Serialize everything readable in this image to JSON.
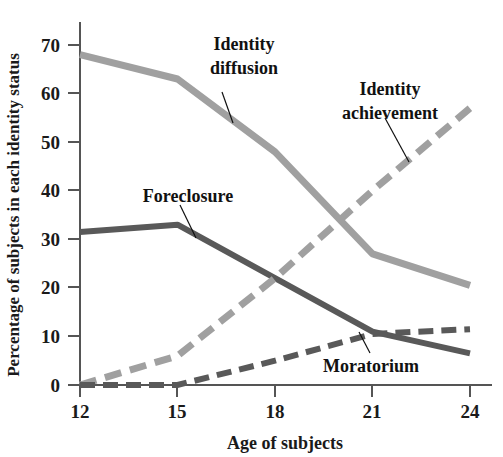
{
  "chart_data": {
    "type": "line",
    "title": "",
    "xlabel": "Age of subjects",
    "ylabel": "Percentage of subjects in each identity status",
    "x": [
      12,
      15,
      18,
      21,
      24
    ],
    "xticks": [
      "12",
      "15",
      "18",
      "21",
      "24"
    ],
    "yticks": [
      "0",
      "10",
      "20",
      "30",
      "40",
      "50",
      "60",
      "70"
    ],
    "xlim": [
      12,
      24
    ],
    "ylim": [
      0,
      72
    ],
    "grid": false,
    "legend": "inline-annotations",
    "series": [
      {
        "name": "Identity diffusion",
        "values": [
          68,
          63,
          48,
          27,
          20.5
        ],
        "style": "solid",
        "color": "#a0a0a0"
      },
      {
        "name": "Foreclosure",
        "values": [
          31.5,
          33,
          22,
          11,
          6.5
        ],
        "style": "solid",
        "color": "#595959"
      },
      {
        "name": "Identity achievement",
        "values": [
          0,
          6,
          22,
          40,
          57
        ],
        "style": "dashed",
        "color": "#a0a0a0"
      },
      {
        "name": "Moratorium",
        "values": [
          0,
          0,
          5,
          10.5,
          11.5
        ],
        "style": "dashed",
        "color": "#595959"
      }
    ],
    "annotations": [
      {
        "text_line1": "Identity",
        "text_line2": "diffusion",
        "label": "Identity diffusion"
      },
      {
        "text_line1": "Identity",
        "text_line2": "achievement",
        "label": "Identity achievement"
      },
      {
        "text_line1": "Foreclosure",
        "text_line2": "",
        "label": "Foreclosure"
      },
      {
        "text_line1": "Moratorium",
        "text_line2": "",
        "label": "Moratorium"
      }
    ]
  },
  "labels": {
    "y_axis_title": "Percentage of subjects in each identity status",
    "x_axis_title": "Age of subjects",
    "identity_diffusion_l1": "Identity",
    "identity_diffusion_l2": "diffusion",
    "identity_achievement_l1": "Identity",
    "identity_achievement_l2": "achievement",
    "foreclosure": "Foreclosure",
    "moratorium": "Moratorium",
    "y0": "0",
    "y10": "10",
    "y20": "20",
    "y30": "30",
    "y40": "40",
    "y50": "50",
    "y60": "60",
    "y70": "70",
    "x12": "12",
    "x15": "15",
    "x18": "18",
    "x21": "21",
    "x24": "24"
  },
  "colors": {
    "light_series": "#a0a0a0",
    "dark_series": "#595959",
    "axis": "#555555",
    "text": "#111111",
    "background": "#ffffff"
  }
}
